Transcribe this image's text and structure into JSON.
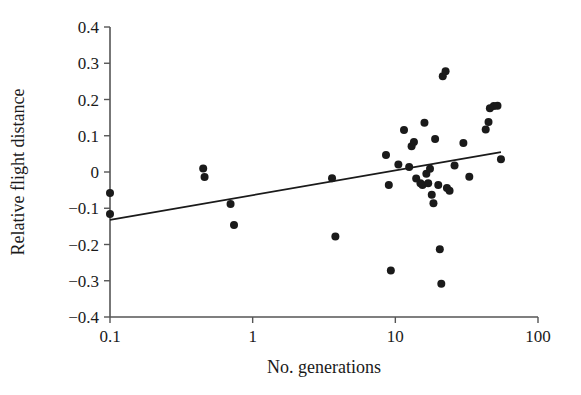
{
  "chart_data": {
    "type": "scatter",
    "title": "",
    "xlabel": "No. generations",
    "ylabel": "Relative flight distance",
    "xscale": "log",
    "yscale": "linear",
    "xlim": [
      0.1,
      100
    ],
    "ylim": [
      -0.4,
      0.4
    ],
    "grid": false,
    "legend": null,
    "xticks": [
      0.1,
      1,
      10,
      100
    ],
    "xticklabels": [
      "0.1",
      "1",
      "10",
      "100"
    ],
    "yticks": [
      -0.4,
      -0.3,
      -0.2,
      -0.1,
      0,
      0.1,
      0.2,
      0.3,
      0.4
    ],
    "yticklabels": [
      "−0.4",
      "−0.3",
      "−0.2",
      "−0.1",
      "0",
      "0.1",
      "0.2",
      "0.3",
      "0.4"
    ],
    "marker": "filled-circle",
    "marker_color": "#1a1a1a",
    "marker_size": 7,
    "series": [
      {
        "name": "Relative flight distance vs No. generations",
        "points": [
          [
            0.1,
            -0.058
          ],
          [
            0.1,
            -0.116
          ],
          [
            0.45,
            0.01
          ],
          [
            0.46,
            -0.014
          ],
          [
            0.7,
            -0.088
          ],
          [
            0.74,
            -0.146
          ],
          [
            3.6,
            -0.017
          ],
          [
            3.8,
            -0.178
          ],
          [
            8.6,
            0.047
          ],
          [
            9.0,
            -0.036
          ],
          [
            9.3,
            -0.272
          ],
          [
            10.5,
            0.021
          ],
          [
            11.5,
            0.116
          ],
          [
            12.5,
            0.014
          ],
          [
            13.0,
            0.071
          ],
          [
            13.5,
            0.083
          ],
          [
            14.0,
            -0.018
          ],
          [
            15.0,
            -0.031
          ],
          [
            15.5,
            -0.036
          ],
          [
            16.0,
            0.136
          ],
          [
            16.5,
            -0.005
          ],
          [
            17.0,
            -0.031
          ],
          [
            17.5,
            0.009
          ],
          [
            18.0,
            -0.063
          ],
          [
            18.5,
            -0.086
          ],
          [
            19.0,
            0.091
          ],
          [
            20.0,
            -0.036
          ],
          [
            20.5,
            -0.213
          ],
          [
            21.0,
            -0.308
          ],
          [
            21.5,
            0.264
          ],
          [
            22.5,
            0.278
          ],
          [
            23.0,
            -0.044
          ],
          [
            24.0,
            -0.052
          ],
          [
            26.0,
            0.018
          ],
          [
            30.0,
            0.08
          ],
          [
            33.0,
            -0.013
          ],
          [
            43.0,
            0.117
          ],
          [
            45.0,
            0.138
          ],
          [
            46.0,
            0.176
          ],
          [
            49.0,
            0.182
          ],
          [
            52.0,
            0.183
          ],
          [
            55.0,
            0.035
          ]
        ]
      }
    ],
    "trendline": {
      "type": "linear-on-log-x",
      "x_start": 0.1,
      "y_start": -0.132,
      "x_end": 55.0,
      "y_end": 0.055,
      "color": "#1a1a1a"
    }
  },
  "axes": {
    "x_title": "No. generations",
    "y_title": "Relative flight distance"
  }
}
